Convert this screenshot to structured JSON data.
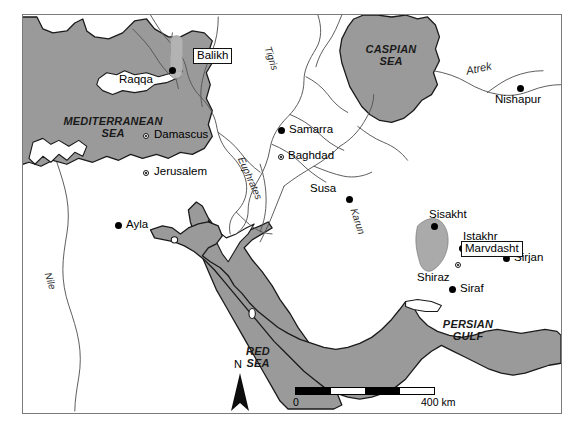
{
  "map": {
    "title": "Map of the Near East and Iran showing Balikh and Marvdasht survey regions",
    "colors": {
      "sea_fill": "#9a9a9a",
      "land_fill": "#ffffff",
      "coast_stroke": "#1a1a1a",
      "river_stroke": "#555555",
      "highlight_fill": "#b4b4b4",
      "frame_stroke": "#7a7a7a"
    },
    "seas": [
      {
        "name": "mediterranean-sea",
        "label": "MEDITERRANEAN\nSEA"
      },
      {
        "name": "red-sea",
        "label": "RED\nSEA"
      },
      {
        "name": "caspian-sea",
        "label": "CASPIAN\nSEA"
      },
      {
        "name": "persian-gulf",
        "label": "PERSIAN\nGULF"
      }
    ],
    "islands": [
      {
        "name": "cyprus",
        "label": ""
      }
    ],
    "rivers": [
      {
        "name": "tigris",
        "label": "Tigris",
        "rotation_deg": 72
      },
      {
        "name": "euphrates",
        "label": "Euphrates",
        "rotation_deg": 66
      },
      {
        "name": "karun",
        "label": "Karun",
        "rotation_deg": 72
      },
      {
        "name": "nile",
        "label": "Nile",
        "rotation_deg": 72
      },
      {
        "name": "atrek",
        "label": "Atrek",
        "rotation_deg": -12
      }
    ],
    "cities": [
      {
        "name": "raqqa",
        "label": "Raqqa",
        "marker": "filled"
      },
      {
        "name": "damascus",
        "label": "Damascus",
        "marker": "ring"
      },
      {
        "name": "jerusalem",
        "label": "Jerusalem",
        "marker": "ring"
      },
      {
        "name": "ayla",
        "label": "Ayla",
        "marker": "filled"
      },
      {
        "name": "samarra",
        "label": "Samarra",
        "marker": "filled"
      },
      {
        "name": "baghdad",
        "label": "Baghdad",
        "marker": "ring"
      },
      {
        "name": "susa",
        "label": "Susa",
        "marker": "filled"
      },
      {
        "name": "sisakht",
        "label": "Sisakht",
        "marker": "filled"
      },
      {
        "name": "istakhr",
        "label": "Istakhr",
        "marker": "filled"
      },
      {
        "name": "shiraz",
        "label": "Shiraz",
        "marker": "ring"
      },
      {
        "name": "sirjan",
        "label": "Sirjan",
        "marker": "filled"
      },
      {
        "name": "siraf",
        "label": "Siraf",
        "marker": "filled"
      },
      {
        "name": "nishapur",
        "label": "Nishapur",
        "marker": "filled"
      }
    ],
    "survey_regions": [
      {
        "name": "balikh",
        "label": "Balikh"
      },
      {
        "name": "marvdasht",
        "label": "Marvdasht"
      }
    ],
    "north_arrow": {
      "label": "N"
    },
    "scale_bar": {
      "start_label": "0",
      "end_label": "400 km",
      "segments": 4,
      "segment_pattern": [
        "fill",
        "empty",
        "fill",
        "empty"
      ]
    }
  }
}
